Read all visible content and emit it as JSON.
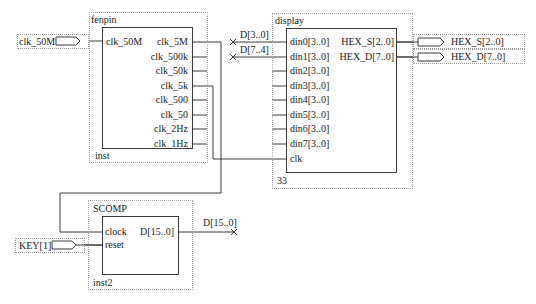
{
  "diagram": {
    "type": "block-schematic",
    "blocks": {
      "fenpin": {
        "name": "fenpin",
        "instance": "inst",
        "inputs": [
          "clk_50M"
        ],
        "outputs": [
          "clk_5M",
          "clk_500k",
          "clk_50k",
          "clk_5k",
          "clk_500",
          "clk_50",
          "clk_2Hz",
          "clk_1Hz"
        ]
      },
      "display": {
        "name": "display",
        "instance": "33",
        "inputs": [
          "din0[3..0]",
          "din1[3..0]",
          "din2[3..0]",
          "din3[3..0]",
          "din4[3..0]",
          "din5[3..0]",
          "din6[3..0]",
          "din7[3..0]",
          "clk"
        ],
        "outputs": [
          "HEX_S[2..0]",
          "HEX_D[7..0]"
        ]
      },
      "scomp": {
        "name": "SCOMP",
        "instance": "inst2",
        "inputs": [
          "clock",
          "reset"
        ],
        "outputs": [
          "D[15..0]"
        ]
      }
    },
    "input_pins": {
      "clk_50M": "clk_50M",
      "key": "KEY[1]"
    },
    "output_pins": {
      "hex_s": "HEX_S[2..0]",
      "hex_d": "HEX_D[7..0]"
    },
    "net_labels": {
      "d30": "D[3..0]",
      "d74": "D[7..4]",
      "d150": "D[15..0]"
    },
    "connections": [
      {
        "from": "clk_50M pin",
        "to": "fenpin.clk_50M"
      },
      {
        "from": "fenpin.clk_5M",
        "to": "SCOMP.clock"
      },
      {
        "from": "fenpin.clk_5k",
        "to": "display.clk"
      },
      {
        "from": "KEY[1] pin",
        "to": "SCOMP.reset"
      },
      {
        "from": "D[3..0]",
        "to": "display.din0[3..0]"
      },
      {
        "from": "D[7..4]",
        "to": "display.din1[3..0]"
      },
      {
        "from": "SCOMP.D[15..0]",
        "to": "D[15..0]"
      },
      {
        "from": "display.HEX_S[2..0]",
        "to": "HEX_S[2..0] pin"
      },
      {
        "from": "display.HEX_D[7..0]",
        "to": "HEX_D[7..0] pin"
      }
    ],
    "colors": {
      "wire": "#3a3a3a",
      "boundary": "#a8a8a8",
      "background": "#ffffff"
    }
  }
}
